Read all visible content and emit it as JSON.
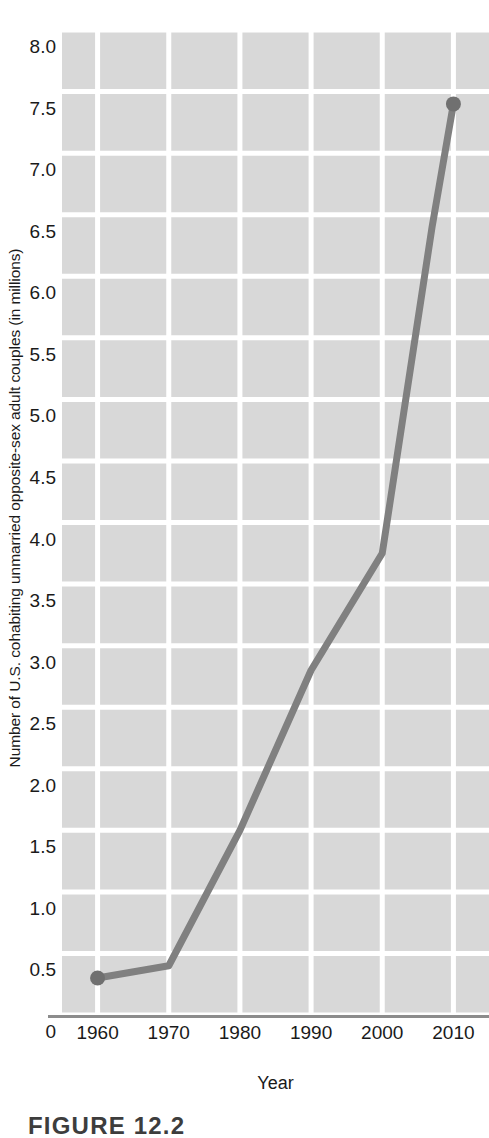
{
  "figure": {
    "caption": "FIGURE 12.2"
  },
  "chart_data": {
    "type": "line",
    "title": "",
    "xlabel": "Year",
    "ylabel": "Number of U.S. cohabiting unmarried opposite-sex adult couples (in millions)",
    "x": [
      1960,
      1970,
      1980,
      1990,
      2000,
      2007,
      2010
    ],
    "values": [
      0.3,
      0.4,
      1.5,
      2.8,
      3.75,
      6.4,
      7.4
    ],
    "series": [
      {
        "name": "U.S. cohabiting unmarried opposite-sex adult couples",
        "values": [
          0.3,
          0.4,
          1.5,
          2.8,
          3.75,
          6.4,
          7.4
        ]
      }
    ],
    "xlim": [
      1955,
      2015
    ],
    "ylim": [
      0,
      8.0
    ],
    "xticks": [
      1960,
      1970,
      1980,
      1990,
      2000,
      2010
    ],
    "xtick_labels": [
      "1960",
      "1970",
      "1980",
      "1990",
      "2000",
      "2010"
    ],
    "yticks": [
      0,
      0.5,
      1.0,
      1.5,
      2.0,
      2.5,
      3.0,
      3.5,
      4.0,
      4.5,
      5.0,
      5.5,
      6.0,
      6.5,
      7.0,
      7.5,
      8.0
    ],
    "ytick_labels": [
      "0",
      "0.5",
      "1.0",
      "1.5",
      "2.0",
      "2.5",
      "3.0",
      "3.5",
      "4.0",
      "4.5",
      "5.0",
      "5.5",
      "6.0",
      "6.5",
      "7.0",
      "7.5",
      "8.0"
    ],
    "grid": true,
    "legend": "none",
    "markers_shown_at": [
      1960,
      2010
    ],
    "colors": {
      "line": "#808080",
      "marker": "#707070",
      "plot_background": "#d8d8d8",
      "gridline": "#ffffff",
      "axis_rule": "#8c8c8c",
      "text": "#1a1a1a"
    }
  }
}
